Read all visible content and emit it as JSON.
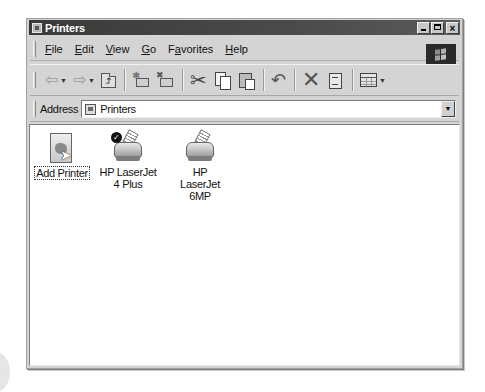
{
  "window": {
    "title": "Printers",
    "controls": {
      "minimize": "_",
      "maximize": "□",
      "close": "×"
    }
  },
  "menubar": {
    "items": [
      {
        "label": "File",
        "accel": "F"
      },
      {
        "label": "Edit",
        "accel": "E"
      },
      {
        "label": "View",
        "accel": "V"
      },
      {
        "label": "Go",
        "accel": "G"
      },
      {
        "label": "Favorites",
        "accel": "a"
      },
      {
        "label": "Help",
        "accel": "H"
      }
    ]
  },
  "toolbar": {
    "buttons": [
      {
        "name": "back",
        "icon": "back-arrow-icon",
        "glyph": "⇦",
        "dropdown": true,
        "enabled": false
      },
      {
        "name": "forward",
        "icon": "forward-arrow-icon",
        "glyph": "⇨",
        "dropdown": true,
        "enabled": false
      },
      {
        "name": "up",
        "icon": "up-folder-icon"
      },
      {
        "name": "move-to",
        "icon": "move-to-icon"
      },
      {
        "name": "copy-to",
        "icon": "copy-to-icon"
      },
      {
        "name": "cut",
        "icon": "scissors-icon",
        "glyph": "✂"
      },
      {
        "name": "copy",
        "icon": "copy-icon"
      },
      {
        "name": "paste",
        "icon": "paste-icon"
      },
      {
        "name": "undo",
        "icon": "undo-icon",
        "glyph": "↶"
      },
      {
        "name": "delete",
        "icon": "delete-icon",
        "glyph": "✕"
      },
      {
        "name": "properties",
        "icon": "properties-icon"
      },
      {
        "name": "views",
        "icon": "views-icon",
        "dropdown": true
      }
    ],
    "dropdown_glyph": "▼"
  },
  "addressbar": {
    "label": "Address",
    "value": "Printers",
    "dropdown_glyph": "▼"
  },
  "content": {
    "items": [
      {
        "label": "Add Printer",
        "icon": "add-printer-icon",
        "selected": true
      },
      {
        "label": "HP LaserJet 4 Plus",
        "icon": "printer-icon",
        "default": true,
        "default_glyph": "✓"
      },
      {
        "label": "HP LaserJet 6MP",
        "icon": "printer-icon",
        "default": false
      }
    ]
  },
  "colors": {
    "titlebar": "#3a3a3a",
    "chrome": "#d4d4d4",
    "content_bg": "#ffffff"
  }
}
